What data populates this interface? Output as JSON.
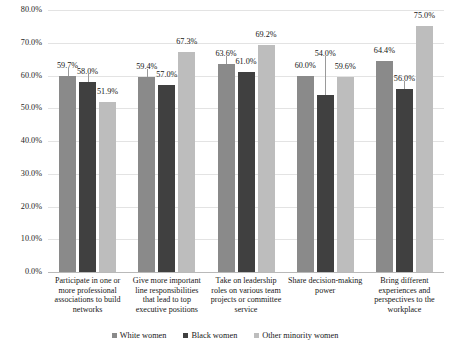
{
  "chart_data": {
    "type": "bar",
    "title": "",
    "subtitle": "",
    "xlabel": "",
    "ylabel": "",
    "ylim": [
      0,
      80
    ],
    "ytick_step": 10,
    "grid": true,
    "legend_position": "bottom",
    "value_suffix": "%",
    "categories": [
      "Participate in one or more professional associations to build networks",
      "Give more important line responsibilities that lead to top executive positions",
      "Take on leadership roles on various team projects or committee service",
      "Share decision-making power",
      "Bring different experiences and perspectives to the workplace"
    ],
    "yticks": [
      "0.0%",
      "10.0%",
      "20.0%",
      "30.0%",
      "40.0%",
      "50.0%",
      "60.0%",
      "70.0%",
      "80.0%"
    ],
    "series": [
      {
        "name": "White women",
        "color": "#8a8a8a",
        "values": [
          59.7,
          59.4,
          63.6,
          60.0,
          64.4
        ],
        "labels": [
          "59.7%",
          "59.4%",
          "63.6%",
          "60.0%",
          "64.4%"
        ]
      },
      {
        "name": "Black women",
        "color": "#404040",
        "values": [
          58.0,
          57.0,
          61.0,
          54.0,
          56.0
        ],
        "labels": [
          "58.0%",
          "57.0%",
          "61.0%",
          "54.0%",
          "56.0%"
        ]
      },
      {
        "name": "Other minority women",
        "color": "#bdbdbd",
        "values": [
          51.9,
          67.3,
          69.2,
          59.6,
          75.0
        ],
        "labels": [
          "51.9%",
          "67.3%",
          "69.2%",
          "59.6%",
          "75.0%"
        ]
      }
    ]
  },
  "legend": {
    "items": [
      {
        "label": "White women"
      },
      {
        "label": "Black women"
      },
      {
        "label": "Other minority women"
      }
    ]
  }
}
